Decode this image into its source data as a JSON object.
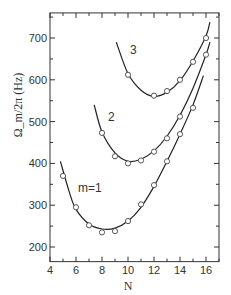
{
  "chart_data": {
    "type": "scatter",
    "title": "",
    "xlabel": "N",
    "ylabel": "Ω_m/2π (Hz)",
    "xlim": [
      4,
      17
    ],
    "ylim": [
      165,
      760
    ],
    "xticks": [
      4,
      6,
      8,
      10,
      12,
      14,
      16
    ],
    "yticks": [
      200,
      300,
      400,
      500,
      600,
      700
    ],
    "grid": false,
    "legend": "none (curves labeled inline)",
    "series": [
      {
        "name": "m=1",
        "label": "m=1",
        "points": [
          {
            "x": 5,
            "y": 370
          },
          {
            "x": 6,
            "y": 295
          },
          {
            "x": 7,
            "y": 252
          },
          {
            "x": 8,
            "y": 235
          },
          {
            "x": 9,
            "y": 238
          },
          {
            "x": 10,
            "y": 262
          },
          {
            "x": 11,
            "y": 302
          },
          {
            "x": 12,
            "y": 348
          },
          {
            "x": 13,
            "y": 405
          },
          {
            "x": 14,
            "y": 470
          },
          {
            "x": 15,
            "y": 533
          }
        ],
        "fit_curve": [
          [
            4.8,
            405
          ],
          [
            5.5,
            330
          ],
          [
            6,
            290
          ],
          [
            7,
            255
          ],
          [
            8,
            243
          ],
          [
            9,
            245
          ],
          [
            10,
            262
          ],
          [
            11,
            295
          ],
          [
            12,
            345
          ],
          [
            13,
            405
          ],
          [
            14,
            470
          ],
          [
            15,
            540
          ],
          [
            15.8,
            610
          ]
        ]
      },
      {
        "name": "m=2",
        "label": "2",
        "points": [
          {
            "x": 8,
            "y": 473
          },
          {
            "x": 9,
            "y": 417
          },
          {
            "x": 10,
            "y": 400
          },
          {
            "x": 11,
            "y": 407
          },
          {
            "x": 12,
            "y": 428
          },
          {
            "x": 13,
            "y": 460
          },
          {
            "x": 14,
            "y": 512
          },
          {
            "x": 16,
            "y": 660
          }
        ],
        "fit_curve": [
          [
            7.4,
            540
          ],
          [
            8,
            475
          ],
          [
            9,
            425
          ],
          [
            10,
            405
          ],
          [
            11,
            410
          ],
          [
            12,
            430
          ],
          [
            13,
            465
          ],
          [
            14,
            515
          ],
          [
            15,
            580
          ],
          [
            16,
            660
          ],
          [
            16.3,
            690
          ]
        ]
      },
      {
        "name": "m=3",
        "label": "3",
        "points": [
          {
            "x": 10,
            "y": 612
          },
          {
            "x": 12,
            "y": 562
          },
          {
            "x": 13,
            "y": 573
          },
          {
            "x": 14,
            "y": 600
          },
          {
            "x": 15,
            "y": 643
          },
          {
            "x": 16,
            "y": 700
          }
        ],
        "fit_curve": [
          [
            9.1,
            690
          ],
          [
            10,
            615
          ],
          [
            11,
            575
          ],
          [
            12,
            560
          ],
          [
            13,
            570
          ],
          [
            14,
            598
          ],
          [
            15,
            645
          ],
          [
            16,
            705
          ],
          [
            16.3,
            738
          ]
        ]
      }
    ]
  }
}
